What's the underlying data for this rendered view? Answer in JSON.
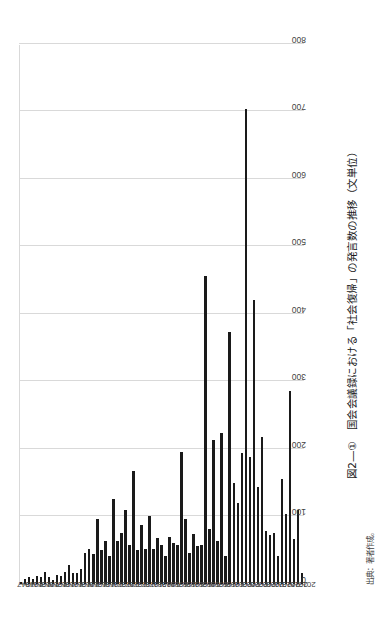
{
  "figure": {
    "caption": "図2―①　国会会議録における「社会復帰」の発言数の推移（文単位）",
    "source": "出典：著者作成。"
  },
  "chart_data": {
    "type": "bar",
    "orientation": "vertical-rotated-90",
    "title": "国会会議録における「社会復帰」の発言数の推移（文単位）",
    "xlabel": "",
    "ylabel": "",
    "ylim": [
      0,
      800
    ],
    "ytick_step": 100,
    "ytick_labels": [
      "0",
      "100",
      "200",
      "300",
      "400",
      "500",
      "600",
      "700",
      "800"
    ],
    "grid": true,
    "legend": "none",
    "bar_color": "#1a1a1a",
    "gridline_color": "#d9d9d9",
    "axis_color": "#a6a6a6",
    "label_every_n_years": 2,
    "categories": [
      "1947",
      "1948",
      "1949",
      "1950",
      "1951",
      "1952",
      "1953",
      "1954",
      "1955",
      "1956",
      "1957",
      "1958",
      "1959",
      "1960",
      "1961",
      "1962",
      "1963",
      "1964",
      "1965",
      "1966",
      "1967",
      "1968",
      "1969",
      "1970",
      "1971",
      "1972",
      "1973",
      "1974",
      "1975",
      "1976",
      "1977",
      "1978",
      "1979",
      "1980",
      "1981",
      "1982",
      "1983",
      "1984",
      "1985",
      "1986",
      "1987",
      "1988",
      "1989",
      "1990",
      "1991",
      "1992",
      "1993",
      "1994",
      "1995",
      "1996",
      "1997",
      "1998",
      "1999",
      "2000",
      "2001",
      "2002",
      "2003",
      "2004",
      "2005",
      "2006",
      "2007",
      "2008",
      "2009",
      "2010",
      "2011",
      "2012",
      "2013",
      "2014",
      "2015",
      "2016",
      "2017"
    ],
    "values": [
      2,
      8,
      10,
      8,
      12,
      10,
      18,
      10,
      6,
      14,
      12,
      18,
      28,
      16,
      16,
      22,
      46,
      52,
      44,
      96,
      50,
      64,
      42,
      126,
      64,
      76,
      110,
      58,
      168,
      50,
      88,
      52,
      100,
      52,
      68,
      58,
      42,
      70,
      60,
      58,
      196,
      96,
      46,
      74,
      56,
      58,
      456,
      82,
      214,
      64,
      224,
      42,
      374,
      150,
      120,
      194,
      704,
      188,
      420,
      144,
      218,
      78,
      72,
      76,
      42,
      156,
      104,
      286,
      66,
      110,
      16
    ]
  }
}
